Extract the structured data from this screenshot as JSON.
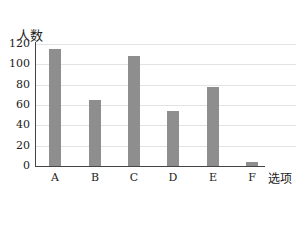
{
  "chart_data": {
    "type": "bar",
    "title": "",
    "xlabel": "选项",
    "ylabel": "人数",
    "categories": [
      "A",
      "B",
      "C",
      "D",
      "E",
      "F"
    ],
    "values": [
      115,
      65,
      108,
      54,
      78,
      4
    ],
    "ylim": [
      0,
      120
    ],
    "yticks": [
      "0",
      "20",
      "40",
      "60",
      "80",
      "100",
      "120"
    ],
    "grid": true,
    "legend": null,
    "bar_color": "#8e8e8e"
  }
}
